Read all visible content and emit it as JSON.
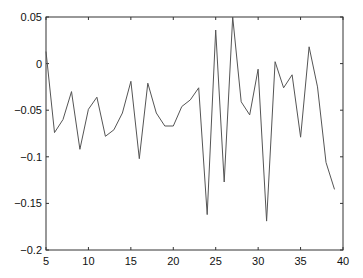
{
  "chart_data": {
    "type": "line",
    "title": "",
    "xlabel": "",
    "ylabel": "",
    "xlim": [
      5,
      40
    ],
    "ylim": [
      -0.2,
      0.05
    ],
    "grid": false,
    "legend": null,
    "x_ticks": [
      5,
      10,
      15,
      20,
      25,
      30,
      35,
      40
    ],
    "x_tick_labels": [
      "5",
      "10",
      "15",
      "20",
      "25",
      "30",
      "35",
      "40"
    ],
    "y_ticks": [
      0.05,
      0,
      -0.05,
      -0.1,
      -0.15,
      -0.2
    ],
    "y_tick_labels": [
      "0.05",
      "0",
      "−0.05",
      "−0.1",
      "−0.15",
      "−0.2"
    ],
    "line_color": "#555555",
    "x": [
      5,
      6,
      7,
      8,
      9,
      10,
      11,
      12,
      13,
      14,
      15,
      16,
      17,
      18,
      19,
      20,
      21,
      22,
      23,
      24,
      25,
      26,
      27,
      28,
      29,
      30,
      31,
      32,
      33,
      34,
      35,
      36,
      37,
      38,
      39
    ],
    "series": [
      {
        "name": "series1",
        "values": [
          0.013,
          -0.074,
          -0.06,
          -0.03,
          -0.092,
          -0.049,
          -0.036,
          -0.078,
          -0.071,
          -0.053,
          -0.019,
          -0.102,
          -0.021,
          -0.053,
          -0.067,
          -0.067,
          -0.046,
          -0.039,
          -0.026,
          -0.162,
          0.036,
          -0.127,
          0.05,
          -0.041,
          -0.055,
          -0.006,
          -0.169,
          0.002,
          -0.026,
          -0.012,
          -0.079,
          0.018,
          -0.025,
          -0.106,
          -0.135
        ]
      }
    ]
  }
}
